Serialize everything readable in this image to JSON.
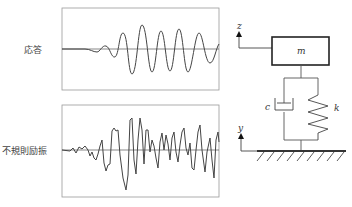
{
  "labels": {
    "response": "応答",
    "excitation": "不規則励振",
    "mass": "m",
    "damper": "c",
    "spring": "k",
    "z_axis": "z",
    "y_axis": "y"
  },
  "colors": {
    "line": "#444444",
    "frame": "#888888",
    "box": "#333333"
  }
}
